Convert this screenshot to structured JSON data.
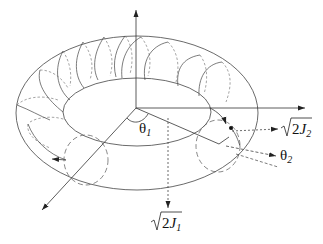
{
  "diagram": {
    "type": "torus-action-angle",
    "labels": {
      "theta1": {
        "symbol": "θ",
        "subscript": "1"
      },
      "theta2": {
        "symbol": "θ",
        "subscript": "2"
      },
      "sqrt2J1": {
        "radical": "√",
        "body": "2",
        "var": "J",
        "subscript": "1"
      },
      "sqrt2J2": {
        "radical": "√",
        "body": "2",
        "var": "J",
        "subscript": "2"
      }
    },
    "colors": {
      "line": "#333333",
      "background": "#ffffff"
    }
  }
}
